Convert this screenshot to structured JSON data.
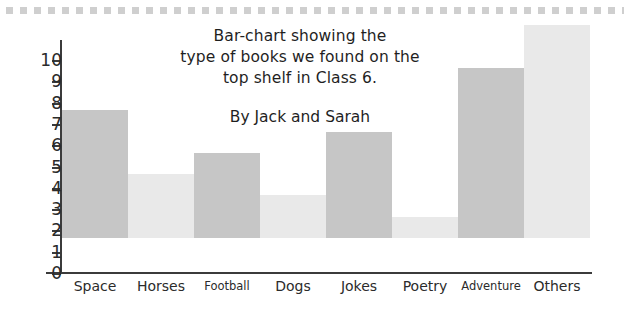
{
  "title": {
    "lines": [
      "Bar-chart showing the",
      "type of books we found on the",
      "top shelf in Class 6."
    ],
    "byline": "By Jack and Sarah"
  },
  "decoration": {
    "top_rule": "dotted-gray-rule"
  },
  "chart_data": {
    "type": "bar",
    "title": "Bar-chart showing the type of books we found on the top shelf in Class 6.",
    "subtitle": "By Jack and Sarah",
    "xlabel": "",
    "ylabel": "",
    "ylim": [
      0,
      10
    ],
    "grid": false,
    "legend": "none",
    "categories": [
      "Space",
      "Horses",
      "Football",
      "Dogs",
      "Jokes",
      "Poetry",
      "Adventure",
      "Others"
    ],
    "values": [
      6,
      3,
      4,
      2,
      5,
      1,
      8,
      10
    ],
    "bar_colors": [
      "#c6c6c6",
      "#e9e9e9",
      "#c6c6c6",
      "#e9e9e9",
      "#c6c6c6",
      "#e9e9e9",
      "#c6c6c6",
      "#e9e9e9"
    ],
    "y_ticks": [
      0,
      1,
      2,
      3,
      4,
      5,
      6,
      7,
      8,
      9,
      10
    ],
    "y_tick_labels": [
      "0",
      "1",
      "2",
      "3",
      "4",
      "5",
      "6",
      "7",
      "8",
      "9",
      "10"
    ]
  },
  "colors": {
    "axis": "#3b3b3b",
    "text": "#2b2b2b",
    "bar_dark": "#c6c6c6",
    "bar_light": "#e9e9e9",
    "rule": "#cfcfcf",
    "background": "#ffffff"
  }
}
